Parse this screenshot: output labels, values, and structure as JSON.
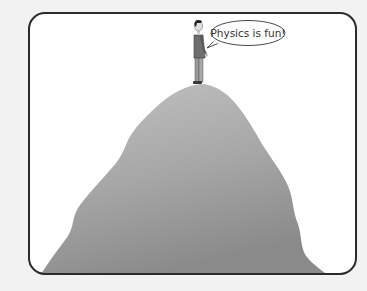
{
  "illustration": {
    "speech_bubble": {
      "text": "Physics is fun!"
    },
    "colors": {
      "background": "#f2f2f2",
      "panel": "#ffffff",
      "frame": "#2b2b2b",
      "mountain_top": "#bdbdbd",
      "mountain_bottom": "#8a8a8a"
    }
  }
}
